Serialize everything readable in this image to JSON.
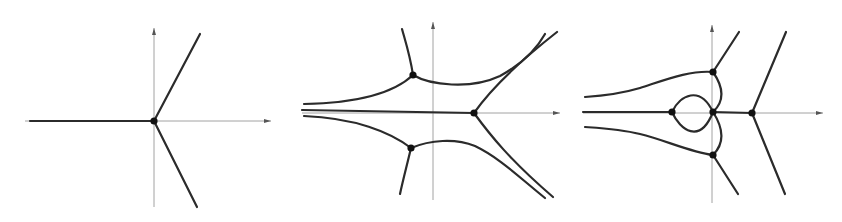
{
  "figure": {
    "colors": {
      "background": "#ffffff",
      "curve": "#2b2b2b",
      "axis": "#8a8a8a",
      "vertex": "#111111"
    },
    "panels": [
      {
        "id": "panel-1",
        "axes": {
          "origin": [
            154,
            121
          ],
          "x_range": [
            25,
            271
          ],
          "y_range": [
            28,
            207
          ]
        },
        "vertices": [
          [
            154,
            121
          ]
        ],
        "edges": [
          "M 30 121 L 154 121",
          "M 154 121 L 200 34",
          "M 154 121 L 197 207"
        ]
      },
      {
        "id": "panel-2",
        "axes": {
          "origin": [
            433,
            113
          ],
          "x_range": [
            302,
            560
          ],
          "y_range": [
            22,
            200
          ]
        },
        "vertices": [
          [
            413,
            75
          ],
          [
            411,
            148
          ],
          [
            474,
            113
          ]
        ],
        "edges": [
          "M 302 110 L 474 113",
          "M 413 75 C 410 55 405 40 402 29",
          "M 413 75 C 395 92 360 103 304 104",
          "M 413 75 C 430 85 470 90 500 76 C 520 65 535 52 545 34",
          "M 474 113 C 490 90 515 65 557 32",
          "M 411 148 C 407 165 403 180 400 194",
          "M 411 148 C 390 132 355 118 304 116",
          "M 411 148 C 430 140 455 138 475 146 C 500 158 520 178 545 198",
          "M 474 113 C 490 135 510 160 553 197"
        ]
      },
      {
        "id": "panel-3",
        "axes": {
          "origin": [
            712,
            113
          ],
          "x_range": [
            583,
            823
          ],
          "y_range": [
            25,
            203
          ]
        },
        "vertices": [
          [
            713,
            72
          ],
          [
            672,
            112
          ],
          [
            713,
            112
          ],
          [
            713,
            155
          ],
          [
            752,
            113
          ]
        ],
        "edges": [
          "M 583 112 L 672 112",
          "M 713 112 L 752 113",
          "M 713 72 L 739 32",
          "M 713 72 C 690 70 665 80 640 88 C 620 94 600 96 585 97",
          "M 713 72 C 722 85 726 100 713 112",
          "M 713 155 C 726 142 722 126 713 112",
          "M 713 155 C 690 152 665 140 640 134 C 620 129 600 128 585 127",
          "M 713 155 L 738 194",
          "M 672 112 C 680 95 700 85 713 112",
          "M 672 112 C 680 130 700 145 713 112",
          "M 752 113 L 786 32",
          "M 752 113 L 785 194"
        ]
      }
    ]
  }
}
